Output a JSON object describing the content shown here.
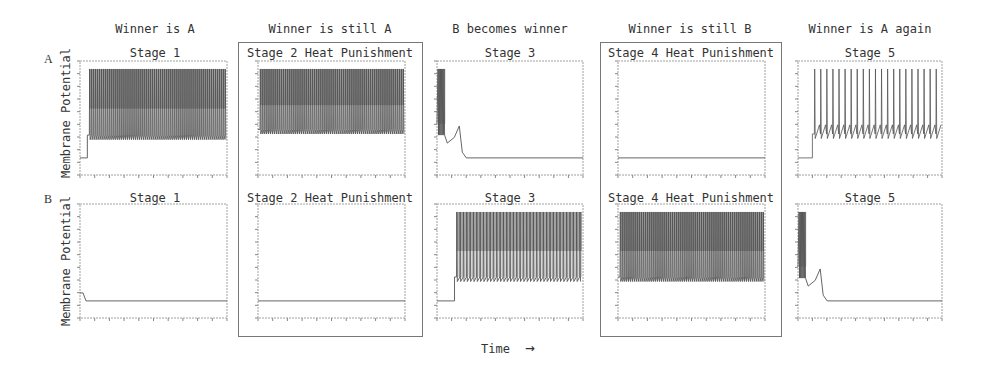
{
  "figure": {
    "row_labels": [
      "A",
      "B"
    ],
    "y_axis_label": "Membrane Potential",
    "x_axis_label": "Time",
    "x_axis_arrow": "→",
    "columns": [
      {
        "header": "Winner is A",
        "boxed": false,
        "stage_A": "Stage 1",
        "stage_B": "Stage 1"
      },
      {
        "header": "Winner is still A",
        "boxed": true,
        "stage_A": "Stage 2  Heat Punishment",
        "stage_B": "Stage 2  Heat Punishment"
      },
      {
        "header": "B becomes winner",
        "boxed": false,
        "stage_A": "Stage 3",
        "stage_B": "Stage 3"
      },
      {
        "header": "Winner is still B",
        "boxed": true,
        "stage_A": "Stage 4  Heat Punishment",
        "stage_B": "Stage 4  Heat Punishment"
      },
      {
        "header": "Winner is A again",
        "boxed": false,
        "stage_A": "Stage 5",
        "stage_B": "Stage 5"
      }
    ]
  },
  "chart_data": [
    {
      "type": "line",
      "title": "Stage 1",
      "row": "A",
      "column_header": "Winner is A",
      "ylabel": "Membrane Potential",
      "pattern": "dense_spiking",
      "resting_level": 0.15,
      "spike_peak": 0.93,
      "trough": 0.35,
      "onset": 0.05,
      "spike_count": 70
    },
    {
      "type": "line",
      "title": "Stage 2  Heat Punishment",
      "row": "A",
      "column_header": "Winner is still A",
      "pattern": "dense_spiking",
      "resting_level": null,
      "spike_peak": 0.93,
      "trough": 0.4,
      "onset": 0.0,
      "spike_count": 75
    },
    {
      "type": "line",
      "title": "Stage 3",
      "row": "A",
      "column_header": "B becomes winner",
      "pattern": "spikes_then_silence",
      "spike_peak": 0.93,
      "spike_end": 0.05,
      "bump_peak": 0.43,
      "resting_level": 0.15
    },
    {
      "type": "line",
      "title": "Stage 4  Heat Punishment",
      "row": "A",
      "column_header": "Winner is still B",
      "pattern": "flat",
      "resting_level": 0.15
    },
    {
      "type": "line",
      "title": "Stage 5",
      "row": "A",
      "column_header": "Winner is A again",
      "pattern": "sparse_spiking",
      "resting_level": 0.15,
      "spike_peak": 0.93,
      "trough": 0.36,
      "onset": 0.1,
      "spike_count": 21
    },
    {
      "type": "line",
      "title": "Stage 1",
      "row": "B",
      "column_header": "Winner is A",
      "ylabel": "Membrane Potential",
      "pattern": "flat",
      "resting_level": 0.15,
      "initial_level": 0.22
    },
    {
      "type": "line",
      "title": "Stage 2  Heat Punishment",
      "row": "B",
      "column_header": "Winner is still A",
      "pattern": "flat",
      "resting_level": 0.15
    },
    {
      "type": "line",
      "title": "Stage 3",
      "row": "B",
      "column_header": "B becomes winner",
      "pattern": "dense_spiking",
      "resting_level": 0.15,
      "spike_peak": 0.93,
      "trough": 0.36,
      "onset": 0.12,
      "spike_count": 38
    },
    {
      "type": "line",
      "title": "Stage 4  Heat Punishment",
      "row": "B",
      "column_header": "Winner is still B",
      "pattern": "dense_spiking",
      "spike_peak": 0.93,
      "trough": 0.36,
      "onset": 0.0,
      "spike_count": 75
    },
    {
      "type": "line",
      "title": "Stage 5",
      "row": "B",
      "column_header": "Winner is A again",
      "pattern": "spikes_then_silence",
      "spike_peak": 0.93,
      "spike_end": 0.05,
      "bump_peak": 0.43,
      "resting_level": 0.15
    }
  ],
  "colors": {
    "trace": "#555555",
    "axis": "#888888",
    "text": "#333333",
    "box": "#777777"
  }
}
